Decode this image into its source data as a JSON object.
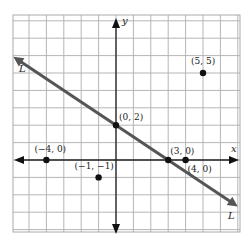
{
  "chart_data": {
    "type": "scatter",
    "title": "",
    "xlabel": "x",
    "ylabel": "y",
    "xlim": [
      -6,
      7
    ],
    "ylim": [
      -6,
      8
    ],
    "grid": true,
    "line": {
      "name": "L",
      "slope": -0.6667,
      "intercept": 2,
      "color": "#555555"
    },
    "points": [
      {
        "x": 5,
        "y": 5,
        "label": "(5, 5)"
      },
      {
        "x": 0,
        "y": 2,
        "label": "(0, 2)"
      },
      {
        "x": 3,
        "y": 0,
        "label": "(3, 0)"
      },
      {
        "x": 4,
        "y": 0,
        "label": "(4, 0)"
      },
      {
        "x": -4,
        "y": 0,
        "label": "(−4, 0)"
      },
      {
        "x": -1,
        "y": -1,
        "label": "(−1, −1)"
      }
    ],
    "line_labels": [
      "L",
      "L"
    ]
  }
}
